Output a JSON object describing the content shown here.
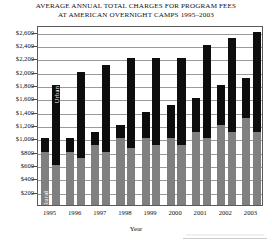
{
  "chart_data": {
    "type": "bar",
    "title": "AVERAGE ANNUAL TOTAL CHARGES FOR PROGRAM FEES AT AMERICAN OVERNIGHT CAMPS 1995–2003",
    "title_lines": [
      "AVERAGE ANNUAL TOTAL CHARGES FOR PROGRAM FEES",
      "AT AMERICAN OVERNIGHT CAMPS 1995–2003"
    ],
    "xlabel": "Year",
    "ylabel": "",
    "categories": [
      "1995",
      "1996",
      "1997",
      "1998",
      "1999",
      "2000",
      "2001",
      "2002",
      "2003"
    ],
    "ylim": [
      0,
      2700
    ],
    "ytick_values": [
      200,
      400,
      600,
      800,
      1000,
      1200,
      1400,
      1600,
      1800,
      2000,
      2200,
      2400,
      2600
    ],
    "ytick_labels": [
      "$200",
      "$400",
      "$600",
      "$800",
      "$1,000",
      "$1,200",
      "$1,400",
      "$1,600",
      "$1,800",
      "$2,000",
      "$2,200",
      "$2,400",
      "$2,600"
    ],
    "grid": true,
    "legend_position": "in-bar annotations",
    "stack_names": [
      "Rural",
      "Urban"
    ],
    "stack_colors": [
      "#808080",
      "#0d0d0d"
    ],
    "in_bar_labels": [
      {
        "text": "Rural",
        "bar": "1995-bar1",
        "segment": "rural"
      },
      {
        "text": "Urban",
        "bar": "1995-bar2",
        "segment": "urban"
      }
    ],
    "series": [
      {
        "name": "Bar 1 – Rural segment",
        "segment": "rural",
        "bar_index": 1,
        "values": [
          800,
          800,
          900,
          1000,
          1000,
          1000,
          1100,
          1200,
          1300
        ]
      },
      {
        "name": "Bar 1 – total (Rural + Urban)",
        "segment": "total",
        "bar_index": 1,
        "values": [
          1000,
          1000,
          1100,
          1200,
          1400,
          1500,
          1600,
          1800,
          1900
        ]
      },
      {
        "name": "Bar 2 – Rural segment",
        "segment": "rural",
        "bar_index": 2,
        "values": [
          600,
          700,
          800,
          850,
          900,
          900,
          1000,
          1100,
          1100
        ]
      },
      {
        "name": "Bar 2 – total (Rural + Urban)",
        "segment": "total",
        "bar_index": 2,
        "values": [
          1800,
          2000,
          2100,
          2200,
          2200,
          2200,
          2400,
          2500,
          2600
        ]
      }
    ]
  }
}
